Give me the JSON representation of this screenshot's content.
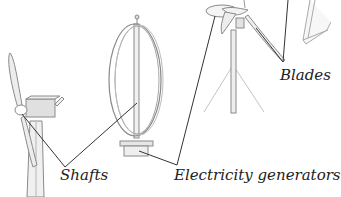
{
  "diagram": {
    "labels": {
      "shafts": "Shafts",
      "electricity_generators": "Electricity generators",
      "blades": "Blades"
    },
    "components": [
      {
        "name": "horizontal-axis-turbine",
        "parts": [
          "blades",
          "hub",
          "nacelle",
          "tower"
        ]
      },
      {
        "name": "vertical-axis-turbine",
        "parts": [
          "curved-blades",
          "shaft",
          "generator-base"
        ]
      },
      {
        "name": "small-horizontal-turbine",
        "parts": [
          "blades",
          "hub",
          "pole",
          "tripod-stand"
        ]
      },
      {
        "name": "partial-turbine",
        "parts": [
          "frame"
        ]
      }
    ],
    "colors": {
      "line": "#333333",
      "drawing_stroke": "#8a8a8a",
      "fill_light": "#f0f0f0",
      "fill_mid": "#e2e2e2",
      "text": "#222222",
      "background": "#ffffff"
    }
  }
}
